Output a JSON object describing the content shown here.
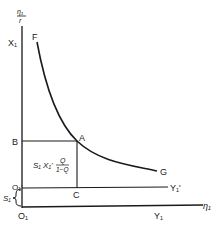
{
  "diagram": {
    "axes": {
      "y_axis_top_label_num": "η₁",
      "y_axis_top_label_den": "r",
      "y_axis_label": "X₁",
      "x_axis_label": "η₁",
      "origin_label": "O₁",
      "shifted_origin_label": "O₁'",
      "bottom_axis_label": "Y₁",
      "shifted_axis_label": "Y₁'"
    },
    "curve": {
      "start_label": "F",
      "end_label": "G",
      "point_label": "A"
    },
    "points": {
      "B": "B",
      "C": "C"
    },
    "region_label": {
      "prefix": "S₁ X₁'",
      "fraction_num": "Q",
      "fraction_den": "1−Q"
    },
    "brace_label": "S₁",
    "colors": {
      "ink": "#1a1a1a",
      "background": "#ffffff"
    }
  }
}
